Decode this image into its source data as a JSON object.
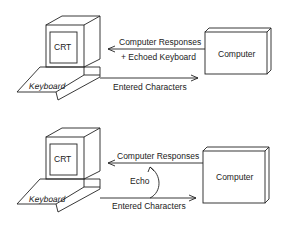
{
  "diagrams": [
    {
      "name": "remote-echo",
      "terminal": {
        "screen_label": "CRT",
        "keyboard_label": "Keyboard"
      },
      "computer_label": "Computer",
      "arrow_to_terminal": {
        "line1": "Computer Responses",
        "line2": "+ Echoed Keyboard"
      },
      "arrow_to_computer": "Entered Characters"
    },
    {
      "name": "local-echo",
      "terminal": {
        "screen_label": "CRT",
        "keyboard_label": "Keyboard"
      },
      "computer_label": "Computer",
      "arrow_to_terminal": {
        "line1": "Computer Responses"
      },
      "echo_label": "Echo",
      "arrow_to_computer": "Entered Characters"
    }
  ]
}
